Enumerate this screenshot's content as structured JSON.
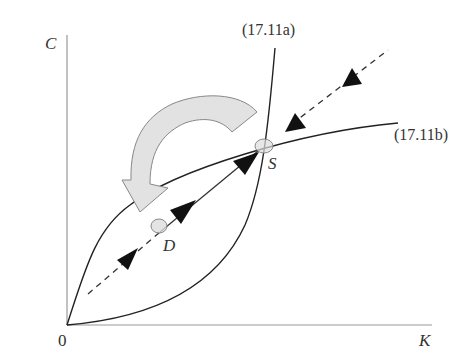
{
  "diagram": {
    "title": "",
    "axes": {
      "y_label": "C",
      "x_label": "K",
      "origin_label": "0"
    },
    "curves": [
      {
        "id": "a",
        "label": "(17.11a)"
      },
      {
        "id": "b",
        "label": "(17.11b)"
      }
    ],
    "points": {
      "steady_state": "S",
      "initial_point": "D"
    },
    "elements": {
      "saddle_path": "dashed stable arm through S with arrows pointing toward S",
      "jump_arrow": "large curved gray arrow indicating a jump downward",
      "markers": "small gray ellipses at S and D"
    },
    "colors": {
      "line": "#222222",
      "axis": "#888888",
      "jump_arrow_fill": "#e2e2e2",
      "jump_arrow_stroke": "#888888",
      "marker_fill": "#dddddd",
      "marker_stroke": "#888888",
      "arrowhead": "#111111"
    }
  }
}
